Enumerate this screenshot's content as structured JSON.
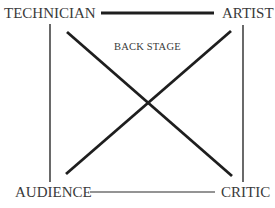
{
  "diagram": {
    "nodes": {
      "top_left": "TECHNICIAN",
      "top_right": "ARTIST",
      "bottom_left": "AUDIENCE",
      "bottom_right": "CRITIC"
    },
    "center_label": "BACK STAGE",
    "edges": [
      {
        "from": "TECHNICIAN",
        "to": "ARTIST",
        "style": "thick"
      },
      {
        "from": "AUDIENCE",
        "to": "CRITIC",
        "style": "thin"
      },
      {
        "from": "TECHNICIAN",
        "to": "AUDIENCE",
        "style": "thin"
      },
      {
        "from": "ARTIST",
        "to": "CRITIC",
        "style": "thin"
      },
      {
        "from": "TECHNICIAN",
        "to": "CRITIC",
        "style": "thick"
      },
      {
        "from": "ARTIST",
        "to": "AUDIENCE",
        "style": "thick"
      }
    ],
    "colors": {
      "line": "#1e1e1e",
      "text": "#3a3a3a",
      "background": "#ffffff"
    }
  }
}
